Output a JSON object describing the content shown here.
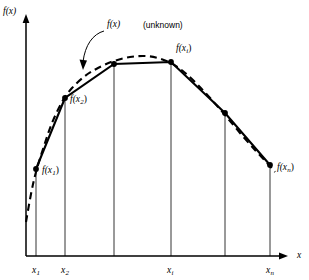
{
  "figure": {
    "background_color": "#ffffff",
    "ink_color": "#000000",
    "width": 309,
    "height": 280
  },
  "axes": {
    "y_label": "f(x)",
    "x_label": "x",
    "origin": {
      "x": 26,
      "y": 256
    },
    "x_axis_end": {
      "x": 288,
      "y": 256
    },
    "y_axis_top": {
      "x": 26,
      "y": 14
    },
    "arrowheads": true,
    "grid": false
  },
  "tick_labels": [
    {
      "text": "x",
      "sub": "1",
      "x": 36,
      "y": 266
    },
    {
      "text": "x",
      "sub": "2",
      "x": 65,
      "y": 266
    },
    {
      "text": "x",
      "sub": "i",
      "x": 171,
      "y": 266
    },
    {
      "text": "x",
      "sub": "n",
      "x": 270,
      "y": 266
    }
  ],
  "point_labels": [
    {
      "id": "f-x1",
      "text": "f(x",
      "sub": "1",
      "tail": ")",
      "x": 42,
      "y": 166
    },
    {
      "id": "f-x2",
      "text": "f(x",
      "sub": "2",
      "tail": ")",
      "x": 70,
      "y": 95
    },
    {
      "id": "f-xi",
      "text": "f(x",
      "sub": "i",
      "tail": ")",
      "x": 176,
      "y": 44
    },
    {
      "id": "f-xn",
      "text": "f(x",
      "sub": "n",
      "tail": ")",
      "x": 277,
      "y": 163
    }
  ],
  "annotation": {
    "function_label": "f(x)",
    "function_label_x": 107,
    "function_label_y": 20,
    "qualifier": "(unknown)",
    "qualifier_x": 143,
    "qualifier_y": 21,
    "leader_path": "M 104 31 C 93 34 85 45 83 62",
    "leader_arrow": "M 83 70 L 79.5 59.5 L 87 60.5 Z"
  },
  "chart_data": {
    "type": "line",
    "xlabel": "x",
    "ylabel": "f(x)",
    "grid": false,
    "legend": "none",
    "x_tick_labels": [
      "x1",
      "x2",
      "xi",
      "xn"
    ],
    "vertical_drop_lines_px": [
      26,
      36,
      65,
      114,
      171,
      225,
      270
    ],
    "series": [
      {
        "name": "f(x) (unknown)",
        "style": "dashed",
        "note": "true smooth curve, drawn dashed",
        "points_px": [
          [
            26,
            222
          ],
          [
            31,
            194
          ],
          [
            36,
            172
          ],
          [
            44,
            146
          ],
          [
            52,
            123
          ],
          [
            62,
            102
          ],
          [
            72,
            88
          ],
          [
            85,
            76
          ],
          [
            98,
            68
          ],
          [
            114,
            61
          ],
          [
            130,
            57
          ],
          [
            145,
            56
          ],
          [
            158,
            58
          ],
          [
            171,
            63
          ],
          [
            184,
            72
          ],
          [
            197,
            84
          ],
          [
            211,
            99
          ],
          [
            225,
            115
          ],
          [
            240,
            133
          ],
          [
            255,
            150
          ],
          [
            268,
            164
          ],
          [
            275,
            172
          ]
        ]
      },
      {
        "name": "piecewise-linear interpolant",
        "style": "solid",
        "note": "chords joining sample points f(x1)...f(xn)",
        "points_px": [
          [
            36,
            169
          ],
          [
            65,
            98
          ],
          [
            114,
            64
          ],
          [
            171,
            62
          ],
          [
            225,
            113
          ],
          [
            270,
            165
          ]
        ]
      }
    ],
    "marked_points": [
      {
        "label": "f(x1)",
        "x_px": 36,
        "y_px": 169
      },
      {
        "label": "f(x2)",
        "x_px": 65,
        "y_px": 98
      },
      {
        "label": "f(xi)",
        "x_px": 171,
        "y_px": 62
      },
      {
        "label": "f(xn)",
        "x_px": 270,
        "y_px": 165
      }
    ],
    "unmarked_vertices": [
      {
        "x_px": 114,
        "y_px": 64
      },
      {
        "x_px": 225,
        "y_px": 113
      }
    ],
    "drop_line_bottom_y_px": 256
  }
}
